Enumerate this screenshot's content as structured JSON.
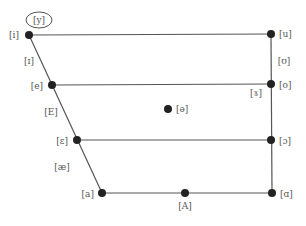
{
  "diagram": {
    "type": "vowel-quadrilateral",
    "colors": {
      "line": "#555555",
      "dot": "#222222",
      "text": "#555555",
      "background": "#ffffff"
    },
    "edges": [
      {
        "from": "i",
        "to": "u",
        "name": "top-edge"
      },
      {
        "from": "e",
        "to": "o",
        "name": "close-mid-edge"
      },
      {
        "from": "ɛ",
        "to": "ɔ",
        "name": "open-mid-edge"
      },
      {
        "from": "a",
        "to": "ɑ",
        "name": "bottom-edge"
      },
      {
        "from": "i",
        "to": "a",
        "name": "front-edge"
      },
      {
        "from": "u",
        "to": "ɑ",
        "name": "back-edge"
      }
    ],
    "vowels": {
      "i": {
        "symbol": "[i]",
        "x": 29,
        "y": 35,
        "has_dot": true
      },
      "u": {
        "symbol": "[u]",
        "x": 271,
        "y": 34,
        "has_dot": true
      },
      "e": {
        "symbol": "[e]",
        "x": 52,
        "y": 85,
        "has_dot": true
      },
      "o": {
        "symbol": "[o]",
        "x": 271,
        "y": 84,
        "has_dot": true
      },
      "schwa": {
        "symbol": "[ə]",
        "x": 168,
        "y": 109,
        "has_dot": true
      },
      "open_e": {
        "symbol": "[ɛ]",
        "x": 77,
        "y": 140,
        "has_dot": true
      },
      "open_o": {
        "symbol": "[ɔ]",
        "x": 271,
        "y": 140,
        "has_dot": true
      },
      "a": {
        "symbol": "[a]",
        "x": 102,
        "y": 193,
        "has_dot": true
      },
      "cap_a": {
        "symbol": "[A]",
        "x": 185,
        "y": 193,
        "has_dot": true
      },
      "script_a": {
        "symbol": "[ɑ]",
        "x": 272,
        "y": 193,
        "has_dot": true
      }
    },
    "intermediate_labels": {
      "y_circled": {
        "symbol": "[y]",
        "circled": true
      },
      "small_i": {
        "symbol": "[ɪ]"
      },
      "cap_e": {
        "symbol": "[E]"
      },
      "ae": {
        "symbol": "[æ]"
      },
      "upsilon": {
        "symbol": "[ʊ]"
      },
      "rams_horn": {
        "symbol": "[ɤ]"
      }
    }
  }
}
